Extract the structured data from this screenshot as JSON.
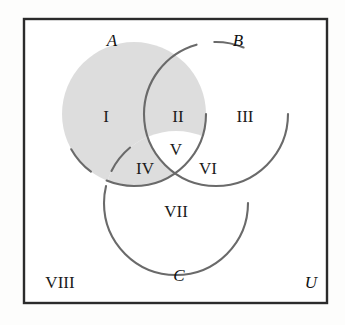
{
  "diagram": {
    "type": "venn-3-set",
    "title": "",
    "universe_label": "U",
    "sets": [
      {
        "id": "A",
        "label": "A",
        "cx": 134,
        "cy": 114,
        "r": 72
      },
      {
        "id": "B",
        "label": "B",
        "cx": 216,
        "cy": 114,
        "r": 72
      },
      {
        "id": "C",
        "label": "C",
        "cx": 176,
        "cy": 203,
        "r": 72
      }
    ],
    "set_label_positions": [
      {
        "label": "A",
        "x": 112,
        "y": 42
      },
      {
        "label": "B",
        "x": 238,
        "y": 42
      },
      {
        "label": "C",
        "x": 179,
        "y": 277
      },
      {
        "label": "U",
        "x": 311,
        "y": 284
      }
    ],
    "regions": [
      {
        "id": "I",
        "label": "I",
        "x": 106,
        "y": 118,
        "membership": "A only",
        "shaded": true
      },
      {
        "id": "II",
        "label": "II",
        "x": 178,
        "y": 118,
        "membership": "A and B only",
        "shaded": true
      },
      {
        "id": "III",
        "label": "III",
        "x": 245,
        "y": 118,
        "membership": "B only",
        "shaded": false
      },
      {
        "id": "IV",
        "label": "IV",
        "x": 145,
        "y": 170,
        "membership": "A and C only",
        "shaded": true
      },
      {
        "id": "V",
        "label": "V",
        "x": 176,
        "y": 151,
        "membership": "A and B and C",
        "shaded": false
      },
      {
        "id": "VI",
        "label": "VI",
        "x": 208,
        "y": 170,
        "membership": "B and C only",
        "shaded": false
      },
      {
        "id": "VII",
        "label": "VII",
        "x": 176,
        "y": 213,
        "membership": "C only",
        "shaded": false
      },
      {
        "id": "VIII",
        "label": "VIII",
        "x": 60,
        "y": 284,
        "membership": "outside all sets",
        "shaded": false
      }
    ],
    "rect": {
      "x": 24,
      "y": 19,
      "width": 303,
      "height": 284
    },
    "colors": {
      "rect_stroke": "#2b2b2b",
      "circle_stroke": "#6a6a6a",
      "shade_fill": "#dddddd",
      "unshaded_fill": "#ffffff",
      "label_text": "#1b1b1b",
      "page_background": "#fdfdfc"
    },
    "shaded_description": "A minus the triple intersection (regions I, II, IV)"
  },
  "bleed_text": {
    "line1": "two ru",
    "line2": "sum",
    "line3": "pb"
  }
}
